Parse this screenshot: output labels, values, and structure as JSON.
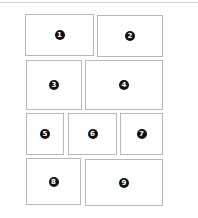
{
  "layout": {
    "rows": 4,
    "border_color": "#b8b8b8",
    "badge_color": "#111111"
  },
  "panels": [
    {
      "label": "1",
      "x": 25,
      "y": 14,
      "w": 69,
      "h": 42
    },
    {
      "label": "2",
      "x": 97,
      "y": 15,
      "w": 66,
      "h": 42
    },
    {
      "label": "3",
      "x": 26,
      "y": 60,
      "w": 56,
      "h": 50
    },
    {
      "label": "4",
      "x": 85,
      "y": 60,
      "w": 78,
      "h": 50
    },
    {
      "label": "5",
      "x": 26,
      "y": 113,
      "w": 38,
      "h": 42
    },
    {
      "label": "6",
      "x": 68,
      "y": 113,
      "w": 49,
      "h": 42
    },
    {
      "label": "7",
      "x": 120,
      "y": 113,
      "w": 43,
      "h": 42
    },
    {
      "label": "8",
      "x": 26,
      "y": 158,
      "w": 55,
      "h": 47
    },
    {
      "label": "9",
      "x": 85,
      "y": 159,
      "w": 78,
      "h": 47
    }
  ]
}
